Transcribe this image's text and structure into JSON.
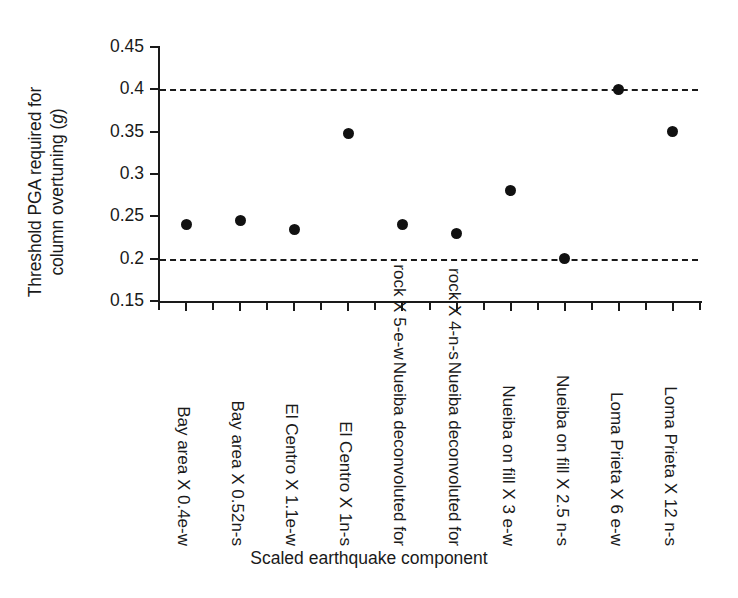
{
  "chart_data": {
    "type": "scatter",
    "title": "",
    "xlabel": "Scaled earthquake component",
    "ylabel_lines": [
      "Threshold PGA required for",
      "column overtuning (",
      "g",
      ")"
    ],
    "ylabel": "Threshold PGA required for column overtuning (g)",
    "ylim": [
      0.15,
      0.45
    ],
    "yticks": [
      "0.45",
      "0.4",
      "0.35",
      "0.3",
      "0.25",
      "0.2",
      "0.15"
    ],
    "ytick_values": [
      0.45,
      0.4,
      0.35,
      0.3,
      0.25,
      0.2,
      0.15
    ],
    "grid": false,
    "legend": "none",
    "categories": [
      "Bay area X 0.4e-w",
      "Bay area X 0.52n-s",
      "El Centro X 1.1e-w",
      "El Centro X 1n-s",
      "Nueiba deconvoluted for rock X 5-e-w",
      "Nueiba deconvoluted for rock X 4-n-s",
      "Nueiba on fill X 3 e-w",
      "Nueiba on fill X 2.5 n-s",
      "Loma  Prieta X 6 e-w",
      "Loma  Prieta X 12 n-s"
    ],
    "category_lines": [
      [
        "Bay area X 0.4e-w"
      ],
      [
        "Bay area X 0.52n-s"
      ],
      [
        "El Centro X 1.1e-w"
      ],
      [
        "El Centro X 1n-s"
      ],
      [
        "Nueiba deconvoluted for",
        "rock X 5-e-w"
      ],
      [
        "Nueiba deconvoluted for",
        "rock X 4-n-s"
      ],
      [
        "Nueiba on fill X 3 e-w"
      ],
      [
        "Nueiba on fill X 2.5 n-s"
      ],
      [
        "Loma  Prieta X 6 e-w"
      ],
      [
        "Loma  Prieta X 12 n-s"
      ]
    ],
    "values": [
      0.24,
      0.245,
      0.235,
      0.348,
      0.24,
      0.23,
      0.28,
      0.2,
      0.4,
      0.35
    ],
    "threshold_lines": [
      {
        "value": 0.4,
        "style": "dashed"
      },
      {
        "value": 0.2,
        "style": "dashed"
      }
    ],
    "marker": {
      "shape": "circle",
      "color": "#111111",
      "size": 11
    },
    "axis_color": "#1a1a1a"
  }
}
